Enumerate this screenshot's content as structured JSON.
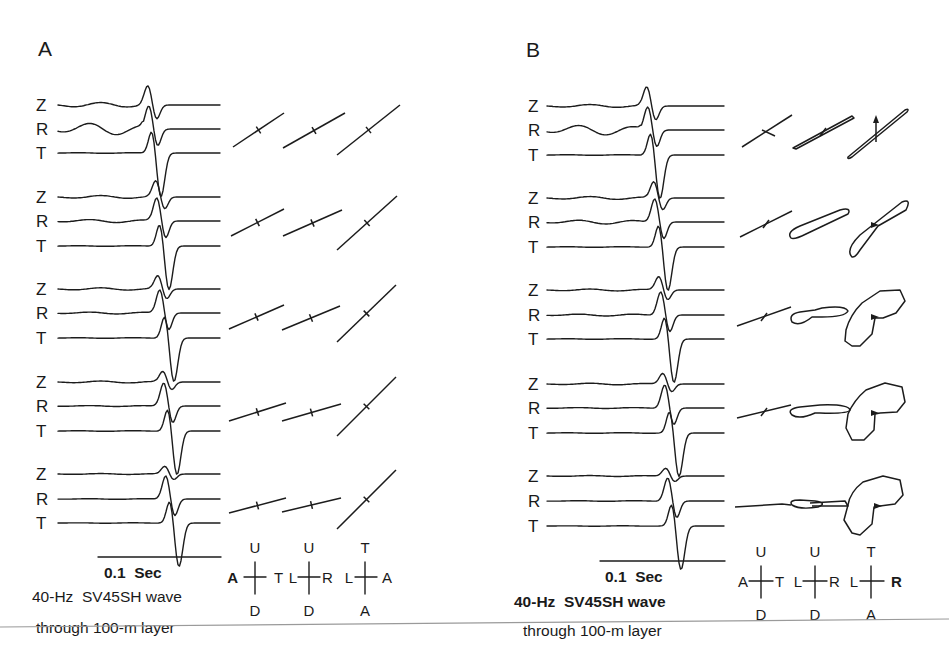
{
  "figure": {
    "panels": [
      {
        "id": "A",
        "label": "A",
        "component_labels": [
          "Z",
          "R",
          "T"
        ],
        "row_count": 5,
        "scale_bar_label": "0.1  Sec",
        "caption_line1": "40-Hz  SV45SH wave",
        "caption_line2": "through 100-m layer",
        "axes_crosses": [
          {
            "top": "U",
            "bottom": "D",
            "left": "A",
            "right": "T"
          },
          {
            "top": "U",
            "bottom": "D",
            "left": "L",
            "right": "R"
          },
          {
            "top": "T",
            "bottom": "A",
            "left": "L",
            "right": "A"
          }
        ]
      },
      {
        "id": "B",
        "label": "B",
        "component_labels": [
          "Z",
          "R",
          "T"
        ],
        "row_count": 5,
        "scale_bar_label": "0.1  Sec",
        "caption_line1": "40-Hz  SV45SH wave",
        "caption_line2": "through 100-m layer",
        "axes_crosses": [
          {
            "top": "U",
            "bottom": "D",
            "left": "A",
            "right": "T"
          },
          {
            "top": "U",
            "bottom": "D",
            "left": "L",
            "right": "R"
          },
          {
            "top": "T",
            "bottom": "A",
            "left": "L",
            "right": "R"
          }
        ]
      }
    ],
    "colors": {
      "ink": "#1c1c1c",
      "background": "#ffffff",
      "page_rule": "#9a9a9a"
    }
  }
}
